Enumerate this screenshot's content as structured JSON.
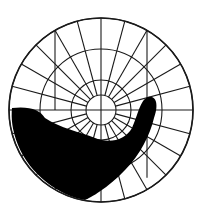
{
  "diagram": {
    "type": "visual-field-perimetry-chart",
    "center": [
      101,
      110
    ],
    "outer_radius": 92,
    "rings": [
      15,
      30,
      61,
      92
    ],
    "meridian_step_deg": 15,
    "vertical_markers_x": [
      55,
      147
    ],
    "colors": {
      "background": "#ffffff",
      "lines": "#1a1a1a",
      "scotoma": "#000000"
    },
    "scotoma_label": "field-defect"
  }
}
